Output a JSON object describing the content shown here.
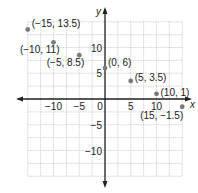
{
  "chart_data": {
    "type": "scatter",
    "title": "",
    "xlabel": "x",
    "ylabel": "y",
    "xlim": [
      -15,
      15
    ],
    "ylim": [
      -15,
      15
    ],
    "grid": true,
    "grid_step": 2.5,
    "x_ticks": [
      "−10",
      "−5",
      "0",
      "5",
      "10"
    ],
    "y_ticks": [
      "10",
      "5",
      "−5",
      "−10"
    ],
    "points": [
      {
        "x": -15,
        "y": 13.5,
        "label": "(−15, 13.5)"
      },
      {
        "x": -10,
        "y": 11,
        "label": "(−10, 11)"
      },
      {
        "x": -5,
        "y": 8.5,
        "label": "(−5, 8.5)"
      },
      {
        "x": 0,
        "y": 6,
        "label": "(0, 6)"
      },
      {
        "x": 5,
        "y": 3.5,
        "label": "(5, 3.5)"
      },
      {
        "x": 10,
        "y": 1,
        "label": "(10, 1)"
      },
      {
        "x": 15,
        "y": -1.5,
        "label": "(15, −1.5)"
      }
    ],
    "colors": {
      "point": "#7a7a7a",
      "axis": "#222222",
      "grid": "#c8c8c8"
    }
  }
}
